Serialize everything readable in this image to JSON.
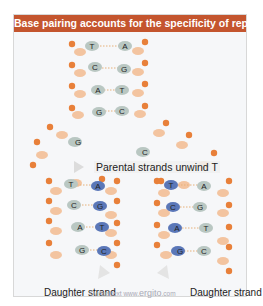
{
  "figure": {
    "title": "Base pairing accounts for the specificity of replication",
    "title_bar_color": "#c4552e",
    "parental_pairs": [
      {
        "left": "T",
        "right": "A"
      },
      {
        "left": "C",
        "right": "G"
      },
      {
        "left": "A",
        "right": "T"
      },
      {
        "left": "G",
        "right": "C"
      }
    ],
    "unwinding_bases": {
      "left": "G",
      "right": "C",
      "right_trailing": "T"
    },
    "unwind_label": "Parental strands unwind",
    "left_daughter_pairs": [
      {
        "parental": "T",
        "new": "A"
      },
      {
        "parental": "C",
        "new": "G"
      },
      {
        "parental": "A",
        "new": "T"
      },
      {
        "parental": "G",
        "new": "C"
      }
    ],
    "right_daughter_pairs": [
      {
        "new": "T",
        "parental": "A"
      },
      {
        "new": "C",
        "parental": "G"
      },
      {
        "new": "A",
        "parental": "T"
      },
      {
        "new": "G",
        "parental": "C"
      }
    ],
    "daughter_label_left": "Daughter strand",
    "daughter_label_right": "Daughter strand",
    "watermark_prefix": "©virtualtext www.",
    "watermark_brand": "ergito",
    "watermark_suffix": ".com",
    "colors": {
      "phosphate": "#e8803a",
      "sugar": "#f3c4a0",
      "parental_base": "#b9c7c2",
      "new_base": "#5a77b8"
    }
  }
}
